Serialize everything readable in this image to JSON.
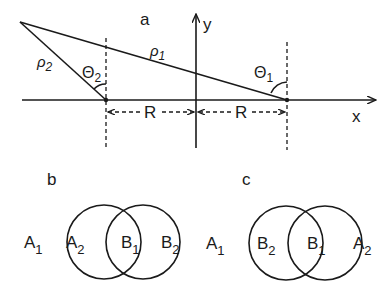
{
  "panel_a": {
    "label": "a",
    "axis_x_label": "x",
    "axis_y_label": "y",
    "rho1": "ρ",
    "rho1_sub": "1",
    "rho2": "ρ",
    "rho2_sub": "2",
    "theta1": "Θ",
    "theta1_sub": "1",
    "theta2": "Θ",
    "theta2_sub": "2",
    "R_left": "R",
    "R_right": "R"
  },
  "panel_b": {
    "label": "b",
    "outer_left": "A",
    "outer_left_sub": "1",
    "inner_left": "A",
    "inner_left_sub": "2",
    "inner_right": "B",
    "inner_right_sub": "1",
    "outer_right": "B",
    "outer_right_sub": "2"
  },
  "panel_c": {
    "label": "c",
    "outer_left": "A",
    "outer_left_sub": "1",
    "inner_left": "B",
    "inner_left_sub": "2",
    "inner_right": "B",
    "inner_right_sub": "1",
    "outer_right": "A",
    "outer_right_sub": "2"
  },
  "colors": {
    "ink": "#1a1a1a",
    "background": "#ffffff"
  }
}
